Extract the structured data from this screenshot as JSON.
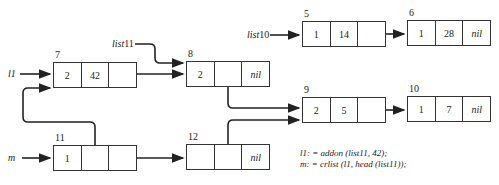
{
  "nodes": [
    {
      "id": "n7",
      "addr": "7",
      "cells": [
        "2",
        "42",
        ""
      ]
    },
    {
      "id": "n8",
      "addr": "8",
      "cells": [
        "2",
        "",
        "nil"
      ]
    },
    {
      "id": "n11",
      "addr": "11",
      "cells": [
        "1",
        "",
        ""
      ]
    },
    {
      "id": "n12",
      "addr": "12",
      "cells": [
        "",
        "",
        "nil"
      ]
    },
    {
      "id": "n5",
      "addr": "5",
      "cells": [
        "1",
        "14",
        ""
      ]
    },
    {
      "id": "n6",
      "addr": "6",
      "cells": [
        "1",
        "28",
        "nil"
      ]
    },
    {
      "id": "n9",
      "addr": "9",
      "cells": [
        "2",
        "5",
        ""
      ]
    },
    {
      "id": "n10",
      "addr": "10",
      "cells": [
        "1",
        "7",
        "nil"
      ]
    }
  ],
  "labels": {
    "l1": "l1",
    "m": "m",
    "list11": "list",
    "list11_num": "11",
    "list10": "list",
    "list10_num": "10"
  },
  "code": {
    "line1": "l1: = addon (list11, 42);",
    "line2": "m: = crlist (l1, head (list11));"
  }
}
